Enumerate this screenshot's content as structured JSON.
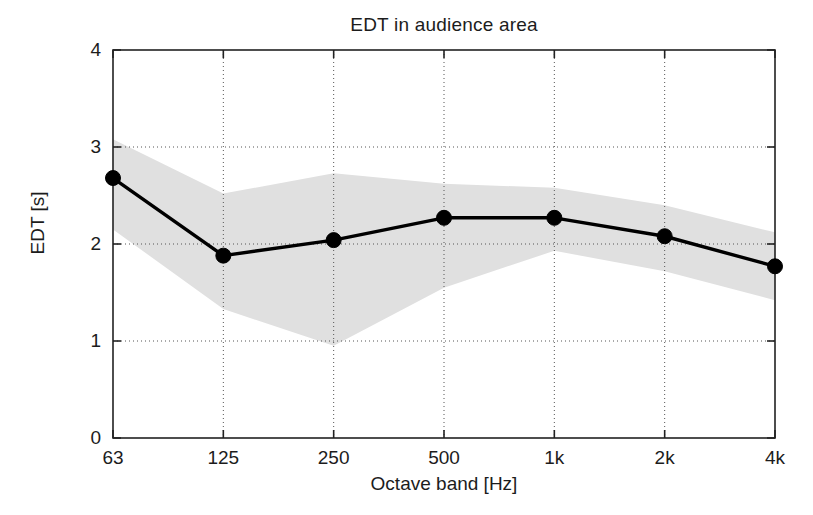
{
  "chart_data": {
    "type": "line",
    "title": "EDT in audience area",
    "xlabel": "Octave band [Hz]",
    "ylabel": "EDT [s]",
    "categories": [
      "63",
      "125",
      "250",
      "500",
      "1k",
      "2k",
      "4k"
    ],
    "xtick_labels": [
      "63",
      "125",
      "250",
      "500",
      "1k",
      "2k",
      "4k"
    ],
    "ytick_labels": [
      "0",
      "1",
      "2",
      "3",
      "4"
    ],
    "ytick_values": [
      0,
      1,
      2,
      3,
      4
    ],
    "ylim": [
      0,
      4
    ],
    "grid": true,
    "grid_style": "dotted",
    "legend": null,
    "series": [
      {
        "name": "EDT mean",
        "style": "line-with-circle-markers",
        "color": "#000000",
        "values": [
          2.68,
          1.88,
          2.04,
          2.27,
          2.27,
          2.08,
          1.77
        ]
      },
      {
        "name": "EDT range (shaded band)",
        "style": "filled-band",
        "color": "#e0e0e0",
        "upper": [
          3.08,
          2.52,
          2.73,
          2.62,
          2.58,
          2.4,
          2.12
        ],
        "lower": [
          2.15,
          1.33,
          0.95,
          1.55,
          1.93,
          1.72,
          1.42
        ]
      }
    ]
  }
}
